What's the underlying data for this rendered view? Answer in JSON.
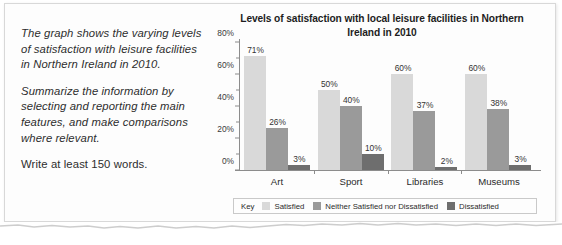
{
  "prompt": {
    "paragraphs": [
      "The graph shows the varying levels of satisfaction with leisure facilities in Northern Ireland in 2010.",
      "Summarize the information by selecting and reporting the main features, and make comparisons where relevant.",
      "Write at least 150 words."
    ]
  },
  "legend": {
    "key_word": "Key",
    "items": [
      {
        "label": "Satisfied",
        "color": "#d9d9d9"
      },
      {
        "label": "Neither Satisfied nor Dissatisfied",
        "color": "#9a9a9a"
      },
      {
        "label": "Dissatisfied",
        "color": "#6e6e6e"
      }
    ]
  },
  "chart_data": {
    "type": "bar",
    "title": "Levels of satisfaction with local leisure facilities in Northern Ireland in 2010",
    "xlabel": "",
    "ylabel": "",
    "ylim": [
      0,
      80
    ],
    "grid": false,
    "legend_position": "bottom",
    "categories": [
      "Art",
      "Sport",
      "Libraries",
      "Museums"
    ],
    "ytick_labels": [
      "0%",
      "20%",
      "40%",
      "60%",
      "80%"
    ],
    "ytick_values": [
      0,
      20,
      40,
      60,
      80
    ],
    "yminor_values": [
      10,
      30,
      50,
      70
    ],
    "series": [
      {
        "name": "Satisfied",
        "color": "#d9d9d9",
        "values": [
          71,
          50,
          60,
          60
        ],
        "labels": [
          "71%",
          "50%",
          "60%",
          "60%"
        ]
      },
      {
        "name": "Neither Satisfied nor Dissatisfied",
        "color": "#9a9a9a",
        "values": [
          26,
          40,
          37,
          38
        ],
        "labels": [
          "26%",
          "40%",
          "37%",
          "38%"
        ]
      },
      {
        "name": "Dissatisfied",
        "color": "#6e6e6e",
        "values": [
          3,
          10,
          2,
          3
        ],
        "labels": [
          "3%",
          "10%",
          "2%",
          "3%"
        ]
      }
    ]
  }
}
